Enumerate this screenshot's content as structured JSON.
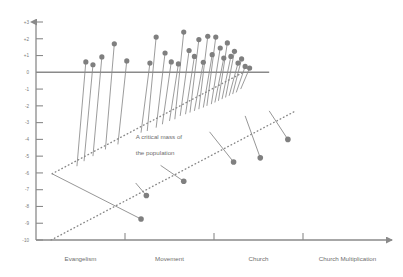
{
  "chart_data": {
    "type": "scatter",
    "title": "",
    "subtitle": "",
    "xlabel": "",
    "ylabel": "",
    "grid": false,
    "legend": null,
    "xlim": [
      0,
      4
    ],
    "ylim": [
      -10,
      3
    ],
    "y_ticks": [
      "+3",
      "+2",
      "+1",
      "0",
      "-1",
      "-2",
      "-3",
      "-4",
      "-5",
      "-6",
      "-7",
      "-8",
      "-9",
      "-10"
    ],
    "y_tick_values": [
      3,
      2,
      1,
      0,
      -1,
      -2,
      -3,
      -4,
      -5,
      -6,
      -7,
      -8,
      -9,
      -10
    ],
    "categories": [
      "Evangelism",
      "Movement",
      "Church",
      "Church Multiplication"
    ],
    "category_x": [
      0.5,
      1.5,
      2.5,
      3.5
    ],
    "x_tick_values": [
      1,
      2,
      3
    ],
    "zero_line_value": 0,
    "annotations": [
      {
        "text": "A critical mass of",
        "x": 1.12,
        "y": -4.0
      },
      {
        "text": "the population",
        "x": 1.12,
        "y": -4.95
      }
    ],
    "trend_lines": [
      {
        "name": "upper-critical-mass-line",
        "style": "dotted",
        "x": [
          0.18,
          2.33
        ],
        "y": [
          -6.05,
          0.0
        ]
      },
      {
        "name": "lower-critical-mass-line",
        "style": "dotted",
        "x": [
          0.17,
          2.9
        ],
        "y": [
          -10.0,
          -2.35
        ]
      }
    ],
    "series": [
      {
        "name": "above-threshold-stems",
        "marker": "circle",
        "color": "#7f7f7f",
        "points": [
          {
            "x": 0.56,
            "y": 0.62,
            "base_y": -5.6
          },
          {
            "x": 0.64,
            "y": 0.45,
            "base_y": -5.3
          },
          {
            "x": 0.74,
            "y": 0.92,
            "base_y": -5.0
          },
          {
            "x": 0.88,
            "y": 1.7,
            "base_y": -4.6
          },
          {
            "x": 1.02,
            "y": 0.68,
            "base_y": -4.3
          },
          {
            "x": 1.28,
            "y": 0.55,
            "base_y": -3.6
          },
          {
            "x": 1.35,
            "y": 2.1,
            "base_y": -3.5
          },
          {
            "x": 1.45,
            "y": 1.15,
            "base_y": -3.3
          },
          {
            "x": 1.52,
            "y": 0.62,
            "base_y": -3.1
          },
          {
            "x": 1.6,
            "y": 0.5,
            "base_y": -2.9
          },
          {
            "x": 1.66,
            "y": 2.4,
            "base_y": -2.8
          },
          {
            "x": 1.72,
            "y": 1.3,
            "base_y": -2.6
          },
          {
            "x": 1.78,
            "y": 0.95,
            "base_y": -2.5
          },
          {
            "x": 1.83,
            "y": 1.95,
            "base_y": -2.4
          },
          {
            "x": 1.88,
            "y": 0.6,
            "base_y": -2.3
          },
          {
            "x": 1.93,
            "y": 2.15,
            "base_y": -2.2
          },
          {
            "x": 1.98,
            "y": 1.05,
            "base_y": -2.1
          },
          {
            "x": 2.02,
            "y": 2.1,
            "base_y": -2.0
          },
          {
            "x": 2.07,
            "y": 1.45,
            "base_y": -1.9
          },
          {
            "x": 2.11,
            "y": 0.85,
            "base_y": -1.8
          },
          {
            "x": 2.15,
            "y": 1.75,
            "base_y": -1.7
          },
          {
            "x": 2.19,
            "y": 0.95,
            "base_y": -1.6
          },
          {
            "x": 2.23,
            "y": 1.25,
            "base_y": -1.5
          },
          {
            "x": 2.27,
            "y": 0.55,
            "base_y": -1.4
          },
          {
            "x": 2.31,
            "y": 0.8,
            "base_y": -1.3
          },
          {
            "x": 2.35,
            "y": 0.35,
            "base_y": -1.2
          },
          {
            "x": 2.4,
            "y": 0.25,
            "base_y": -1.0
          }
        ]
      },
      {
        "name": "below-threshold-segments",
        "marker": "circle",
        "color": "#7f7f7f",
        "segments": [
          {
            "x1": 0.18,
            "y1": -6.05,
            "x2": 1.18,
            "y2": -8.75
          },
          {
            "x1": 1.12,
            "y1": -6.6,
            "x2": 1.24,
            "y2": -7.35
          },
          {
            "x1": 1.4,
            "y1": -5.55,
            "x2": 1.66,
            "y2": -6.5
          },
          {
            "x1": 1.95,
            "y1": -3.55,
            "x2": 2.22,
            "y2": -5.35
          },
          {
            "x1": 2.35,
            "y1": -2.6,
            "x2": 2.52,
            "y2": -5.1
          },
          {
            "x1": 2.62,
            "y1": -2.3,
            "x2": 2.83,
            "y2": -4.0
          }
        ]
      }
    ]
  },
  "colors": {
    "axis": "#8a8a8a",
    "marker": "#7f7f7f",
    "stem": "#8a8a8a",
    "dotted": "#8a8a8a",
    "text": "#6e6e6e",
    "background": "#ffffff"
  }
}
